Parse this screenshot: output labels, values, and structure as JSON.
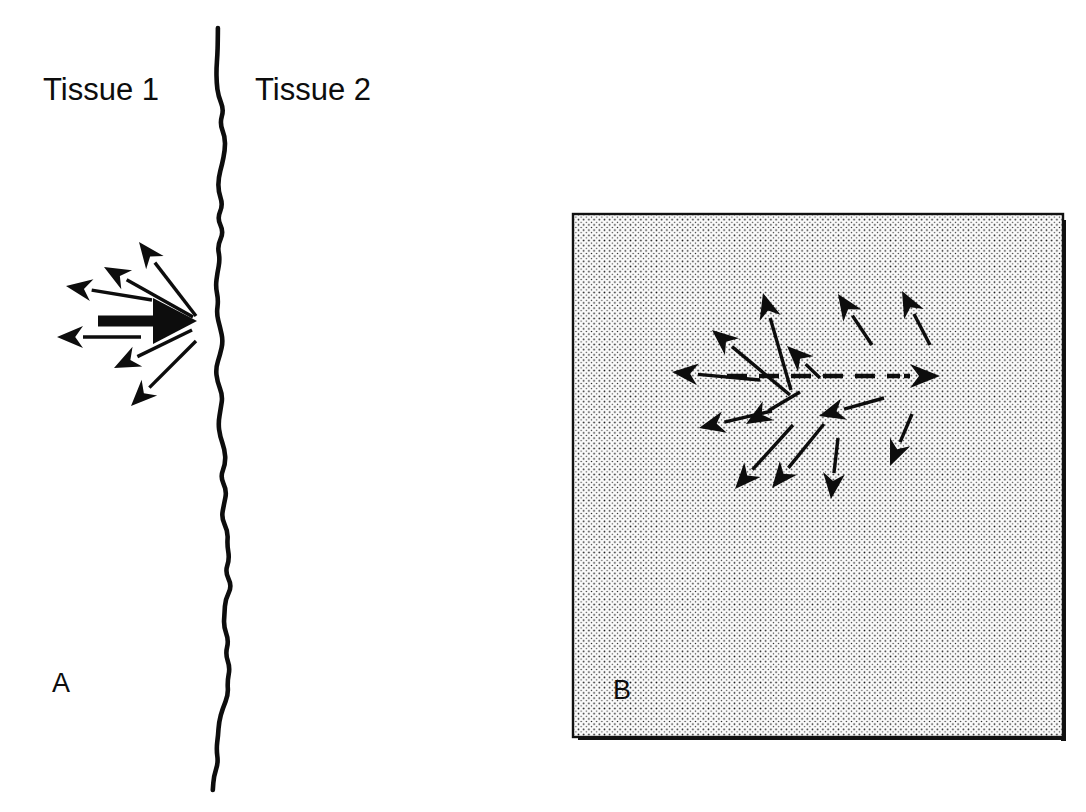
{
  "figure": {
    "background_color": "#ffffff",
    "ink_color": "#0d0d0d",
    "width": 1086,
    "height": 812
  },
  "panel_a": {
    "letter": "A",
    "letter_x": 52,
    "letter_y": 692,
    "left_label": "Tissue 1",
    "left_label_x": 43,
    "left_label_y": 100,
    "right_label": "Tissue 2",
    "right_label_x": 255,
    "right_label_y": 100,
    "boundary": {
      "name": "tissue-interface-wavy-line",
      "stroke_width": 4.6,
      "y_start": 28,
      "y_end": 790,
      "x_center": 216
    },
    "bold_arrow": {
      "name": "net-flux-arrow",
      "direction": "right",
      "tail_x": 98,
      "tail_y": 321,
      "tip_x": 197,
      "tip_y": 321,
      "shaft_width": 11,
      "head_length": 44,
      "head_half_width": 23
    },
    "thin_arrows": [
      {
        "tail_x": 196,
        "tail_y": 316,
        "tip_x": 139,
        "tip_y": 242,
        "label": "up-left-steep"
      },
      {
        "tail_x": 193,
        "tail_y": 317,
        "tip_x": 104,
        "tip_y": 267,
        "label": "up-left-mid"
      },
      {
        "tail_x": 152,
        "tail_y": 300,
        "tip_x": 66,
        "tip_y": 286,
        "label": "up-left-shallow"
      },
      {
        "tail_x": 141,
        "tail_y": 337,
        "tip_x": 57,
        "tip_y": 337,
        "label": "left-horizontal"
      },
      {
        "tail_x": 192,
        "tail_y": 330,
        "tip_x": 114,
        "tip_y": 368,
        "label": "down-left-shallow"
      },
      {
        "tail_x": 196,
        "tail_y": 341,
        "tip_x": 131,
        "tip_y": 406,
        "label": "down-left-steep"
      }
    ]
  },
  "panel_b": {
    "letter": "B",
    "letter_x": 613,
    "letter_y": 699,
    "frame": {
      "name": "tissue-region-box",
      "x": 573,
      "y": 214,
      "width": 490,
      "height": 523,
      "border_width": 2.4,
      "shadow_width": 5,
      "fill_pattern": "fine-dot-stipple",
      "dot_color": "#1a1a1a",
      "dot_spacing": 5.2,
      "dot_radius": 0.85,
      "fill_color": "#fbfbfb"
    },
    "dashed_axis": {
      "name": "bidirectional-dashed-axis",
      "y": 376,
      "left_tip_x": 668,
      "right_tip_x": 940,
      "dash_start_x": 727,
      "dash_end_x": 900,
      "dash_length": 20,
      "dash_gap": 12,
      "stroke_width": 4.5
    },
    "thin_arrows": [
      {
        "tail_x": 790,
        "tail_y": 395,
        "tip_x": 712,
        "tip_y": 330,
        "label": "up-left-far"
      },
      {
        "tail_x": 791,
        "tail_y": 390,
        "tip_x": 763,
        "tip_y": 293,
        "label": "up-near-vertical"
      },
      {
        "tail_x": 820,
        "tail_y": 378,
        "tip_x": 787,
        "tip_y": 346,
        "label": "up-left-short"
      },
      {
        "tail_x": 872,
        "tail_y": 345,
        "tip_x": 838,
        "tip_y": 294,
        "label": "up-left-right-side"
      },
      {
        "tail_x": 930,
        "tail_y": 345,
        "tip_x": 902,
        "tip_y": 291,
        "label": "up-left-far-right"
      },
      {
        "tail_x": 760,
        "tail_y": 380,
        "tip_x": 672,
        "tip_y": 372,
        "label": "left-axis-head"
      },
      {
        "tail_x": 800,
        "tail_y": 392,
        "tip_x": 746,
        "tip_y": 424,
        "label": "down-left-inner"
      },
      {
        "tail_x": 772,
        "tail_y": 411,
        "tip_x": 699,
        "tip_y": 428,
        "label": "down-left-outer"
      },
      {
        "tail_x": 884,
        "tail_y": 398,
        "tip_x": 819,
        "tip_y": 416,
        "label": "left-lower-right"
      },
      {
        "tail_x": 793,
        "tail_y": 425,
        "tip_x": 735,
        "tip_y": 489,
        "label": "down-left-steep"
      },
      {
        "tail_x": 824,
        "tail_y": 424,
        "tip_x": 772,
        "tip_y": 488,
        "label": "down-left-steep-2"
      },
      {
        "tail_x": 838,
        "tail_y": 438,
        "tip_x": 831,
        "tip_y": 499,
        "label": "down-vertical"
      },
      {
        "tail_x": 912,
        "tail_y": 414,
        "tip_x": 890,
        "tip_y": 466,
        "label": "down-left-right-edge"
      }
    ]
  },
  "arrow_style": {
    "thin_shaft_width": 3.4,
    "thin_head_length": 26,
    "thin_head_half_width": 11
  }
}
